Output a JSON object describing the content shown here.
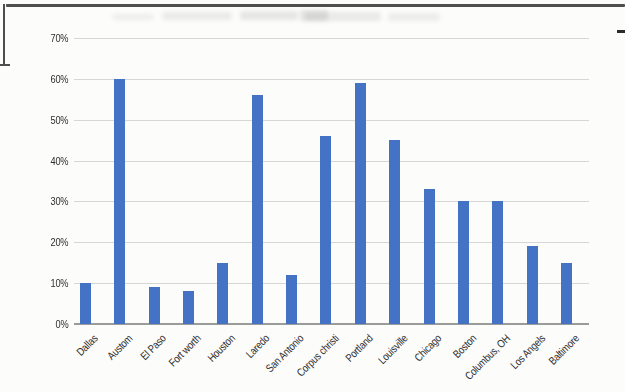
{
  "page": {
    "background_color": "#fcfcfb",
    "border_color": "#4e4e4e"
  },
  "colors": {
    "bar": "#4472C4",
    "gridline": "#d6d6d6",
    "axis_line": "#9b9b9b",
    "text": "#2e2e2e"
  },
  "chart_data": {
    "type": "bar",
    "categories": [
      "Dallas",
      "Austom",
      "El Paso",
      "Fort worth",
      "Houston",
      "Laredo",
      "San Antonio",
      "Corpus christi",
      "Portland",
      "Louisville",
      "Chicago",
      "Boston",
      "Columbus, OH",
      "Los Angels",
      "Baltimore"
    ],
    "values": [
      10,
      60,
      9,
      8,
      15,
      56,
      12,
      46,
      59,
      45,
      33,
      30,
      30,
      19,
      15
    ],
    "title": "",
    "xlabel": "",
    "ylabel": "",
    "ylim": [
      0,
      70
    ],
    "yticks": [
      0,
      10,
      20,
      30,
      40,
      50,
      60,
      70
    ],
    "ytick_labels": [
      "0%",
      "10%",
      "20%",
      "30%",
      "40%",
      "50%",
      "60%",
      "70%"
    ],
    "grid": true,
    "legend": false,
    "bar_color": "#4472C4",
    "x_label_rotation_deg": -45
  }
}
